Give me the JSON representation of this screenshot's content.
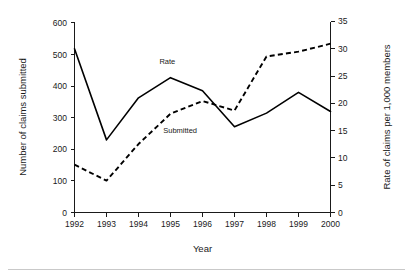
{
  "chart_data": {
    "type": "line",
    "title": "",
    "xlabel": "Year",
    "ylabel": "Number of claims submitted",
    "y2label": "Rate of claims per 1,000 members",
    "x": [
      1992,
      1993,
      1994,
      1995,
      1996,
      1997,
      1998,
      1999,
      2000
    ],
    "xtick_labels": [
      "1992",
      "1993",
      "1994",
      "1995",
      "1996",
      "1997",
      "1998",
      "1999",
      "2000"
    ],
    "xlim": [
      1992,
      2000
    ],
    "ylim": [
      0,
      600
    ],
    "ytick_labels": [
      "0",
      "100",
      "200",
      "300",
      "400",
      "500",
      "600"
    ],
    "ytick_values": [
      0,
      100,
      200,
      300,
      400,
      500,
      600
    ],
    "y2lim": [
      0,
      35
    ],
    "y2tick_labels": [
      "0",
      "5",
      "10",
      "15",
      "20",
      "25",
      "30",
      "35"
    ],
    "y2tick_values": [
      0,
      5,
      10,
      15,
      20,
      25,
      30,
      35
    ],
    "grid": false,
    "legend_position": "inline-annotations",
    "series": [
      {
        "name": "Rate",
        "axis": "right",
        "style": "solid",
        "color": "#000000",
        "values": [
          30.0,
          13.3,
          21.0,
          24.7,
          22.3,
          15.7,
          18.2,
          22.0,
          18.5
        ]
      },
      {
        "name": "Submitted",
        "axis": "left",
        "style": "dashed",
        "color": "#000000",
        "values": [
          150,
          100,
          215,
          310,
          350,
          320,
          490,
          505,
          530
        ]
      }
    ],
    "annotations": [
      {
        "text": "Rate",
        "x": 1994.9,
        "y_axis": "right",
        "y": 27.2
      },
      {
        "text": "Submitted",
        "x": 1995.3,
        "y_axis": "left",
        "y": 250
      }
    ]
  }
}
